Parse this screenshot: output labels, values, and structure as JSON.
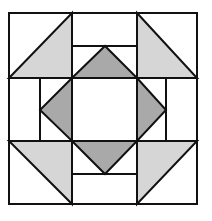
{
  "diagram": {
    "type": "quilt-block",
    "colors": {
      "background": "#ffffff",
      "stroke": "#111111",
      "light_fill": "#d6d6d6",
      "medium_fill": "#a9a9a9"
    },
    "stroke_width": 2,
    "outer": {
      "x": 9,
      "y": 13,
      "width": 188,
      "height": 191
    },
    "grid_lines": {
      "vertical_x": [
        40,
        72,
        137,
        166
      ],
      "horizontal_y": [
        46,
        78,
        141,
        174
      ]
    },
    "center_square": {
      "x": 72,
      "y": 78,
      "width": 65,
      "height": 63,
      "fill": "#ffffff"
    },
    "corner_triangles": [
      {
        "name": "top-left",
        "points": "9,78 72,13 72,78",
        "fill": "#d6d6d6"
      },
      {
        "name": "top-right",
        "points": "137,13 197,78 137,78",
        "fill": "#d6d6d6"
      },
      {
        "name": "bottom-left",
        "points": "9,141 72,141 72,204",
        "fill": "#d6d6d6"
      },
      {
        "name": "bottom-right",
        "points": "137,141 197,141 137,204",
        "fill": "#d6d6d6"
      }
    ],
    "corner_cells": [
      {
        "name": "top-left",
        "x": 9,
        "y": 13,
        "w": 63,
        "h": 65
      },
      {
        "name": "top-right",
        "x": 137,
        "y": 13,
        "w": 60,
        "h": 65
      },
      {
        "name": "bottom-left",
        "x": 9,
        "y": 141,
        "w": 63,
        "h": 63
      },
      {
        "name": "bottom-right",
        "x": 137,
        "y": 141,
        "w": 60,
        "h": 63
      }
    ],
    "diamond_triangles": [
      {
        "name": "top",
        "points": "72,78 105,46 137,78",
        "fill": "#a9a9a9"
      },
      {
        "name": "right",
        "points": "137,78 166,110 137,141",
        "fill": "#a9a9a9"
      },
      {
        "name": "bottom",
        "points": "72,141 105,174 137,141",
        "fill": "#a9a9a9"
      },
      {
        "name": "left",
        "points": "72,78 40,110 72,141",
        "fill": "#a9a9a9"
      }
    ],
    "side_rects": [
      {
        "name": "top-band",
        "x": 72,
        "y": 46,
        "w": 65,
        "h": 32
      },
      {
        "name": "bottom-band",
        "x": 72,
        "y": 141,
        "w": 65,
        "h": 33
      },
      {
        "name": "left-band",
        "x": 40,
        "y": 78,
        "w": 32,
        "h": 63
      },
      {
        "name": "right-band",
        "x": 137,
        "y": 78,
        "w": 29,
        "h": 63
      }
    ]
  }
}
